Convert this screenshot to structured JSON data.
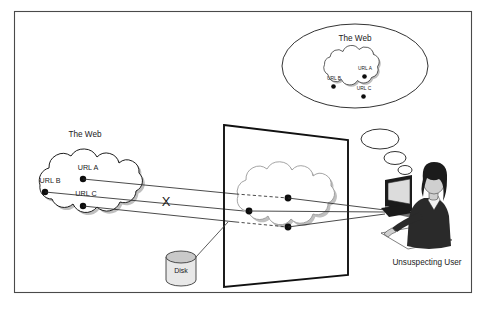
{
  "figure": {
    "frame": {
      "name": "outer-border"
    }
  },
  "source_web": {
    "caption": "The Web",
    "urls": [
      {
        "id": "a",
        "label": "URL A"
      },
      {
        "id": "b",
        "label": "URL B"
      },
      {
        "id": "c",
        "label": "URL C"
      }
    ]
  },
  "attacker_plane": {
    "name": "attacker-proxy-plane",
    "cloud_label": "",
    "urls": [
      {
        "id": "a",
        "label": ""
      },
      {
        "id": "b",
        "label": ""
      },
      {
        "id": "c",
        "label": ""
      }
    ]
  },
  "blocked_marker": {
    "label": "X"
  },
  "storage": {
    "label": "Disk"
  },
  "user": {
    "label": "Unsuspecting User"
  },
  "thought_bubble": {
    "caption": "The Web",
    "urls": [
      {
        "id": "a",
        "label": "URL A"
      },
      {
        "id": "b",
        "label": "URL B"
      },
      {
        "id": "c",
        "label": "URL C"
      }
    ]
  },
  "colors": {
    "frame": "#4a4a4a",
    "plane": "#111111",
    "cloud_stroke": "#1d1d1d",
    "cloud_inner_stroke": "#9a9a9a",
    "shadow": "#bfbfbf",
    "link": "#2b2b2b",
    "text": "#1a1a1a",
    "disk_body": "#e8e8e8",
    "disk_top": "#c9c9c9"
  }
}
